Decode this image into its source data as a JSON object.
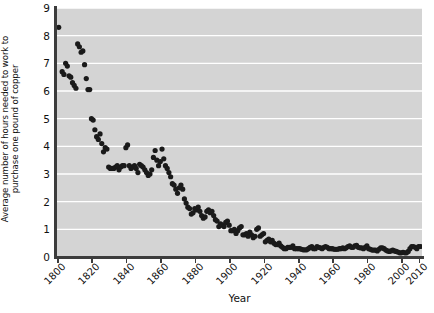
{
  "chart_data": {
    "type": "scatter",
    "title": "",
    "xlabel": "Year",
    "ylabel_lines": [
      "Average number of hours needed to work to",
      "purchase one pound of copper"
    ],
    "ylabel": "Average number of hours needed to work to purchase one pound of copper",
    "xlim": [
      1800,
      2012
    ],
    "ylim": [
      0,
      9
    ],
    "xticks": [
      1800,
      1820,
      1840,
      1860,
      1880,
      1900,
      1920,
      1940,
      1960,
      1980,
      2000,
      2010
    ],
    "xtick_labels": [
      "1800",
      "1820",
      "1840",
      "1860",
      "1880",
      "1900",
      "1920",
      "1940",
      "1960",
      "1980",
      "2000",
      "2010"
    ],
    "yticks": [
      0,
      1,
      2,
      3,
      4,
      5,
      6,
      7,
      8,
      9
    ],
    "ytick_labels": [
      "0",
      "1",
      "2",
      "3",
      "4",
      "5",
      "6",
      "7",
      "8",
      "9"
    ],
    "grid": "horizontal-white",
    "plot_background": "#d4d4d4",
    "gridline_color": "#ffffff",
    "marker_color": "#1a1a1a",
    "marker_size": 2.6,
    "legend": null,
    "x": [
      1801,
      1803,
      1804,
      1805,
      1806,
      1807,
      1808,
      1809,
      1810,
      1811,
      1812,
      1813,
      1814,
      1815,
      1816,
      1817,
      1818,
      1819,
      1820,
      1821,
      1822,
      1823,
      1824,
      1825,
      1826,
      1827,
      1828,
      1829,
      1830,
      1831,
      1832,
      1833,
      1834,
      1835,
      1836,
      1837,
      1838,
      1839,
      1840,
      1841,
      1842,
      1843,
      1844,
      1845,
      1846,
      1847,
      1848,
      1849,
      1850,
      1851,
      1852,
      1853,
      1854,
      1855,
      1856,
      1857,
      1858,
      1859,
      1860,
      1861,
      1862,
      1863,
      1864,
      1865,
      1866,
      1867,
      1868,
      1869,
      1870,
      1871,
      1872,
      1873,
      1874,
      1875,
      1876,
      1877,
      1878,
      1879,
      1880,
      1881,
      1882,
      1883,
      1884,
      1885,
      1886,
      1887,
      1888,
      1889,
      1890,
      1891,
      1892,
      1893,
      1894,
      1895,
      1896,
      1897,
      1898,
      1899,
      1900,
      1901,
      1902,
      1903,
      1904,
      1905,
      1906,
      1907,
      1908,
      1909,
      1910,
      1911,
      1912,
      1913,
      1914,
      1915,
      1916,
      1917,
      1918,
      1919,
      1920,
      1921,
      1922,
      1923,
      1924,
      1925,
      1926,
      1927,
      1928,
      1929,
      1930,
      1931,
      1932,
      1933,
      1934,
      1935,
      1936,
      1937,
      1938,
      1939,
      1940,
      1941,
      1942,
      1943,
      1944,
      1945,
      1946,
      1947,
      1948,
      1949,
      1950,
      1951,
      1952,
      1953,
      1954,
      1955,
      1956,
      1957,
      1958,
      1959,
      1960,
      1961,
      1962,
      1963,
      1964,
      1965,
      1966,
      1967,
      1968,
      1969,
      1970,
      1971,
      1972,
      1973,
      1974,
      1975,
      1976,
      1977,
      1978,
      1979,
      1980,
      1981,
      1982,
      1983,
      1984,
      1985,
      1986,
      1987,
      1988,
      1989,
      1990,
      1991,
      1992,
      1993,
      1994,
      1995,
      1996,
      1997,
      1998,
      1999,
      2000,
      2001,
      2002,
      2003,
      2004,
      2005,
      2006,
      2007,
      2008,
      2009,
      2010,
      2011
    ],
    "y": [
      8.3,
      6.7,
      6.6,
      7.0,
      6.9,
      6.55,
      6.5,
      6.3,
      6.2,
      6.1,
      7.7,
      7.6,
      7.4,
      7.45,
      6.95,
      6.45,
      6.05,
      6.05,
      5.0,
      4.95,
      4.6,
      4.35,
      4.25,
      4.45,
      4.1,
      3.8,
      3.95,
      3.9,
      3.25,
      3.2,
      3.2,
      3.2,
      3.25,
      3.3,
      3.15,
      3.25,
      3.3,
      3.3,
      3.95,
      4.05,
      3.3,
      3.2,
      3.25,
      3.3,
      3.2,
      3.05,
      3.35,
      3.3,
      3.25,
      3.15,
      3.05,
      2.95,
      3.0,
      3.15,
      3.6,
      3.85,
      3.5,
      3.3,
      3.45,
      3.9,
      3.55,
      3.3,
      3.2,
      3.05,
      2.9,
      2.65,
      2.6,
      2.45,
      2.3,
      2.5,
      2.6,
      2.45,
      2.1,
      1.95,
      1.8,
      1.75,
      1.55,
      1.6,
      1.75,
      1.7,
      1.8,
      1.65,
      1.5,
      1.4,
      1.45,
      1.65,
      1.7,
      1.6,
      1.65,
      1.5,
      1.35,
      1.3,
      1.1,
      1.2,
      1.15,
      1.1,
      1.25,
      1.3,
      1.15,
      0.95,
      0.95,
      1.0,
      0.85,
      0.95,
      1.05,
      1.1,
      0.8,
      0.8,
      0.85,
      0.75,
      0.9,
      0.8,
      0.7,
      0.75,
      1.0,
      1.05,
      0.75,
      0.8,
      0.85,
      0.55,
      0.6,
      0.65,
      0.55,
      0.6,
      0.5,
      0.45,
      0.45,
      0.5,
      0.4,
      0.35,
      0.3,
      0.3,
      0.35,
      0.35,
      0.35,
      0.4,
      0.3,
      0.3,
      0.3,
      0.3,
      0.28,
      0.26,
      0.26,
      0.26,
      0.3,
      0.35,
      0.38,
      0.3,
      0.3,
      0.38,
      0.35,
      0.33,
      0.3,
      0.35,
      0.38,
      0.35,
      0.3,
      0.3,
      0.3,
      0.28,
      0.28,
      0.28,
      0.3,
      0.3,
      0.33,
      0.3,
      0.33,
      0.38,
      0.4,
      0.35,
      0.35,
      0.4,
      0.42,
      0.35,
      0.33,
      0.33,
      0.3,
      0.35,
      0.4,
      0.3,
      0.28,
      0.25,
      0.25,
      0.25,
      0.22,
      0.28,
      0.33,
      0.33,
      0.3,
      0.25,
      0.22,
      0.2,
      0.22,
      0.25,
      0.22,
      0.2,
      0.18,
      0.15,
      0.15,
      0.17,
      0.15,
      0.15,
      0.2,
      0.3,
      0.38,
      0.38,
      0.35,
      0.3,
      0.38,
      0.38
    ]
  }
}
